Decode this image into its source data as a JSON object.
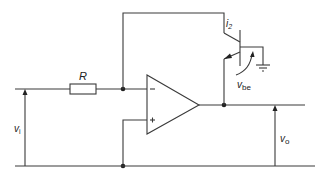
{
  "diagram": {
    "labels": {
      "resistor": "R",
      "current": "i",
      "current_sub": "2",
      "vbe": "v",
      "vbe_sub": "be",
      "vin": "v",
      "vin_sub": "i",
      "vout": "v",
      "vout_sub": "o",
      "inv_input": "−",
      "noninv_input": "+"
    },
    "colors": {
      "line": "#3a3a3a",
      "text": "#222222",
      "background": "#ffffff"
    }
  }
}
